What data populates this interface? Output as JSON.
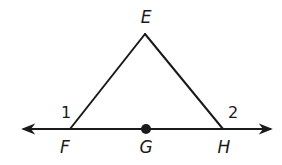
{
  "diagram": {
    "type": "geometry-triangle-on-line",
    "points": {
      "E": {
        "label": "E",
        "x": 145,
        "y": 34,
        "label_x": 146,
        "label_y": 23
      },
      "F": {
        "label": "F",
        "x": 70,
        "y": 129,
        "label_x": 65,
        "label_y": 153
      },
      "G": {
        "label": "G",
        "x": 146,
        "y": 129,
        "label_x": 146,
        "label_y": 153
      },
      "H": {
        "label": "H",
        "x": 223,
        "y": 129,
        "label_x": 224,
        "label_y": 153
      }
    },
    "line": {
      "x1": 24,
      "y1": 129,
      "x2": 270,
      "y2": 129,
      "arrows": "both"
    },
    "segments": [
      {
        "from": "E",
        "to": "F"
      },
      {
        "from": "E",
        "to": "H"
      }
    ],
    "angles": [
      {
        "label": "1",
        "vertex": "F",
        "x": 66,
        "y": 118
      },
      {
        "label": "2",
        "vertex": "H",
        "x": 233,
        "y": 118
      }
    ],
    "marked_point": "G",
    "colors": {
      "stroke": "#1a1a1a",
      "background": "#ffffff"
    }
  }
}
